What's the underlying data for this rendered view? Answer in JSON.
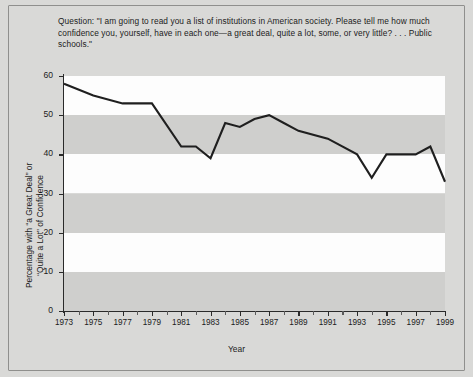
{
  "figure": {
    "question": "Question: \"I am going to read you a list of institutions in American society. Please tell me how much confidence you, yourself, have in each one—a great deal, quite a lot, some, or very little? . . . Public schools.\"",
    "ylabel_line1": "Percentage with “a Great Deal” or",
    "ylabel_line2": "“Quite a Lot” of Confidence",
    "xlabel": "Year",
    "line_color": "#1f1f1f",
    "band_gray": "#cfcfcd",
    "band_white": "#fdfdfd",
    "background": "#d9d9d7"
  },
  "chart_data": {
    "type": "line",
    "title": "",
    "xlabel": "Year",
    "ylabel": "Percentage with “a Great Deal” or “Quite a Lot” of Confidence",
    "xlim": [
      1973,
      1999
    ],
    "ylim": [
      0,
      60
    ],
    "ytick_values": [
      0,
      10,
      20,
      30,
      40,
      50,
      60
    ],
    "ytick_labels": [
      "0",
      "10",
      "20",
      "30",
      "40",
      "50",
      "60"
    ],
    "xtick_values": [
      1973,
      1974,
      1975,
      1976,
      1977,
      1978,
      1979,
      1980,
      1981,
      1982,
      1983,
      1984,
      1985,
      1986,
      1987,
      1988,
      1989,
      1990,
      1991,
      1992,
      1993,
      1994,
      1995,
      1996,
      1997,
      1998,
      1999
    ],
    "xtick_labels_shown": [
      "1973",
      "1975",
      "1977",
      "1979",
      "1981",
      "1983",
      "1985",
      "1987",
      "1989",
      "1991",
      "1993",
      "1995",
      "1997",
      "1999"
    ],
    "grid": false,
    "banded_background": true,
    "band_interval": 10,
    "legend": null,
    "x": [
      1973,
      1975,
      1977,
      1979,
      1981,
      1982,
      1983,
      1984,
      1985,
      1986,
      1987,
      1988,
      1989,
      1991,
      1993,
      1994,
      1995,
      1996,
      1997,
      1998,
      1999
    ],
    "values": [
      58,
      55,
      53,
      53,
      42,
      42,
      39,
      48,
      47,
      49,
      50,
      48,
      46,
      44,
      40,
      34,
      40,
      40,
      40,
      42,
      33
    ],
    "series": [
      {
        "name": "Confidence in public schools",
        "points": [
          {
            "year": 1973,
            "value": 58
          },
          {
            "year": 1975,
            "value": 55
          },
          {
            "year": 1977,
            "value": 53
          },
          {
            "year": 1979,
            "value": 53
          },
          {
            "year": 1981,
            "value": 42
          },
          {
            "year": 1982,
            "value": 42
          },
          {
            "year": 1983,
            "value": 39
          },
          {
            "year": 1984,
            "value": 48
          },
          {
            "year": 1985,
            "value": 47
          },
          {
            "year": 1986,
            "value": 49
          },
          {
            "year": 1987,
            "value": 50
          },
          {
            "year": 1988,
            "value": 48
          },
          {
            "year": 1989,
            "value": 46
          },
          {
            "year": 1991,
            "value": 44
          },
          {
            "year": 1993,
            "value": 40
          },
          {
            "year": 1994,
            "value": 34
          },
          {
            "year": 1995,
            "value": 40
          },
          {
            "year": 1996,
            "value": 40
          },
          {
            "year": 1997,
            "value": 40
          },
          {
            "year": 1998,
            "value": 42
          },
          {
            "year": 1999,
            "value": 33
          }
        ]
      }
    ]
  }
}
